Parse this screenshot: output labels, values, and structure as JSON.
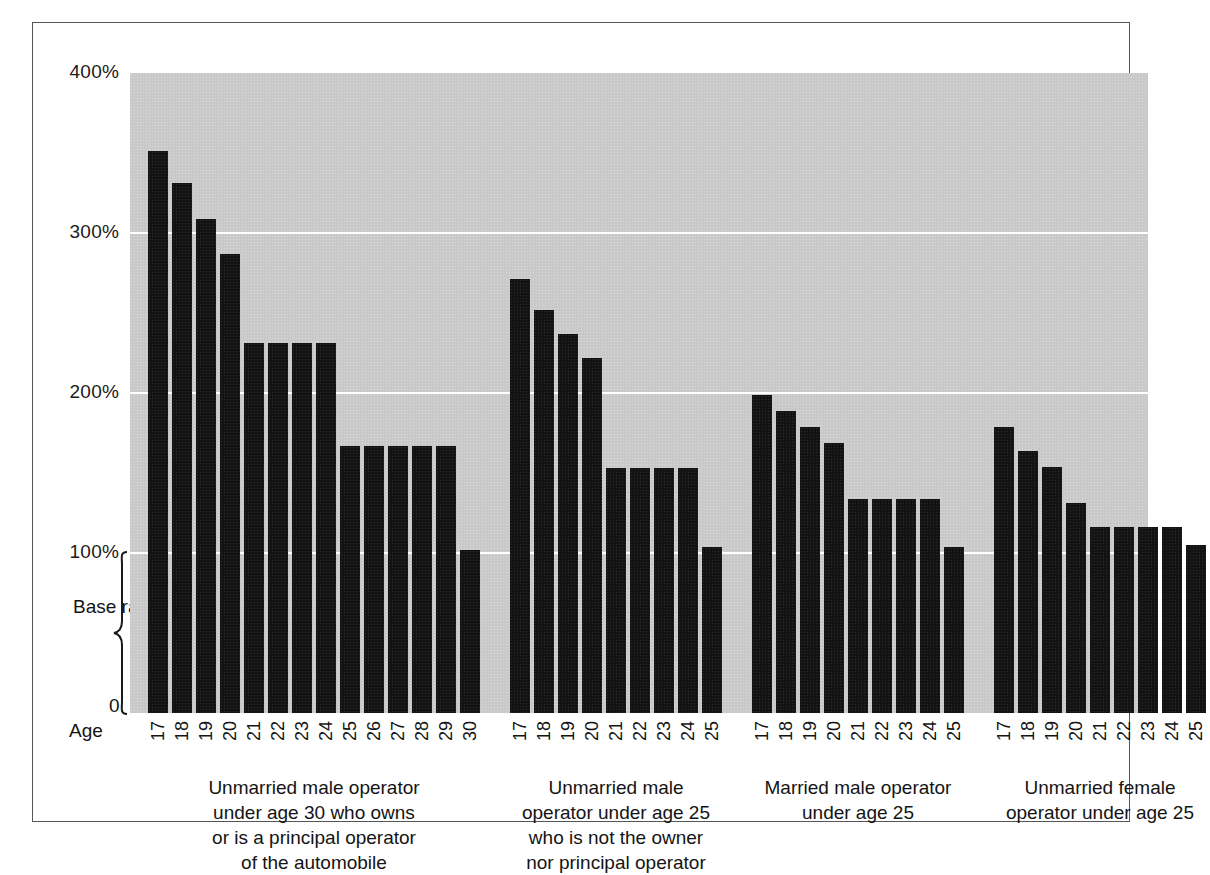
{
  "chart_data": {
    "type": "bar",
    "title": "",
    "xlabel": "Age",
    "ylabel": "",
    "ylim": [
      0,
      400
    ],
    "grid": true,
    "legend": "none",
    "y_tick_labels": [
      "400%",
      "300%",
      "200%",
      "100%",
      "0"
    ],
    "y_tick_values": [
      400,
      300,
      200,
      100,
      0
    ],
    "annotations": [
      {
        "name": "base-rate-bracket",
        "text": "Base\nrate",
        "from": 0,
        "to": 100
      }
    ],
    "groups": [
      {
        "caption": "Unmarried male operator\nunder age 30 who owns\nor is a principal operator\nof the automobile",
        "categories": [
          "17",
          "18",
          "19",
          "20",
          "21",
          "22",
          "23",
          "24",
          "25",
          "26",
          "27",
          "28",
          "29",
          "30"
        ],
        "values": [
          351,
          331,
          309,
          287,
          231,
          231,
          231,
          231,
          167,
          167,
          167,
          167,
          167,
          102
        ]
      },
      {
        "caption": "Unmarried male\noperator under age 25\nwho is not the owner\nnor principal operator",
        "categories": [
          "17",
          "18",
          "19",
          "20",
          "21",
          "22",
          "23",
          "24",
          "25"
        ],
        "values": [
          271,
          252,
          237,
          222,
          153,
          153,
          153,
          153,
          104
        ]
      },
      {
        "caption": "Married male operator\nunder age 25",
        "categories": [
          "17",
          "18",
          "19",
          "20",
          "21",
          "22",
          "23",
          "24",
          "25"
        ],
        "values": [
          199,
          189,
          179,
          169,
          134,
          134,
          134,
          134,
          104
        ]
      },
      {
        "caption": "Unmarried female\noperator under age 25",
        "categories": [
          "17",
          "18",
          "19",
          "20",
          "21",
          "22",
          "23",
          "24",
          "25"
        ],
        "values": [
          179,
          164,
          154,
          131,
          116,
          116,
          116,
          116,
          105
        ]
      }
    ],
    "colors": {
      "bar": "#131313",
      "plot_background": "#c9c9c9",
      "gridline": "#ffffff",
      "page_background": "#ffffff",
      "text": "#141414",
      "frame": "#555555"
    }
  }
}
